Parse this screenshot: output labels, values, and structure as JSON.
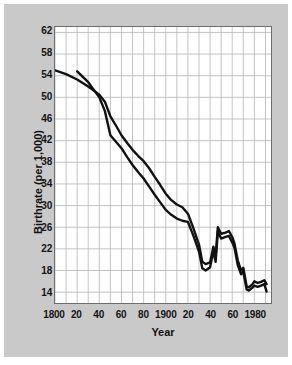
{
  "figure": {
    "background_color": "#c9c9c9",
    "plot_background_color": "#ffffff",
    "grid_color": "#b4b4b4",
    "axis_color": "#6e6e6e",
    "line_color": "#111111"
  },
  "chart_data": {
    "type": "line",
    "title": "",
    "xlabel": "Year",
    "ylabel": "Birthrate (per 1,000)",
    "xlim": [
      1800,
      1995
    ],
    "ylim": [
      12,
      63
    ],
    "grid": true,
    "legend": "none",
    "xticks": [
      {
        "value": 1800,
        "label": "1800"
      },
      {
        "value": 1820,
        "label": "20"
      },
      {
        "value": 1840,
        "label": "40"
      },
      {
        "value": 1860,
        "label": "60"
      },
      {
        "value": 1880,
        "label": "80"
      },
      {
        "value": 1900,
        "label": "1900"
      },
      {
        "value": 1920,
        "label": "20"
      },
      {
        "value": 1940,
        "label": "40"
      },
      {
        "value": 1960,
        "label": "60"
      },
      {
        "value": 1980,
        "label": "1980"
      }
    ],
    "xminor_step": 10,
    "yticks": [
      {
        "value": 62,
        "label": "62"
      },
      {
        "value": 58,
        "label": "58"
      },
      {
        "value": 54,
        "label": "54"
      },
      {
        "value": 50,
        "label": "50"
      },
      {
        "value": 46,
        "label": "46"
      },
      {
        "value": 42,
        "label": "42"
      },
      {
        "value": 38,
        "label": "38"
      },
      {
        "value": 34,
        "label": "34"
      },
      {
        "value": 30,
        "label": "30"
      },
      {
        "value": 26,
        "label": "26"
      },
      {
        "value": 22,
        "label": "22"
      },
      {
        "value": 18,
        "label": "18"
      },
      {
        "value": 14,
        "label": "14"
      }
    ],
    "series": [
      {
        "name": "series-upper",
        "x": [
          1800,
          1810,
          1820,
          1830,
          1840,
          1845,
          1850,
          1855,
          1860,
          1865,
          1870,
          1875,
          1880,
          1885,
          1890,
          1895,
          1900,
          1905,
          1910,
          1915,
          1920,
          1925,
          1930,
          1933,
          1936,
          1940,
          1943,
          1945,
          1947,
          1950,
          1954,
          1957,
          1960,
          1962,
          1965,
          1968,
          1970,
          1973,
          1975,
          1978,
          1980,
          1983,
          1986,
          1989,
          1991
        ],
        "y": [
          55.0,
          54.3,
          53.3,
          52.0,
          50.5,
          49.2,
          46.5,
          44.8,
          43.0,
          41.6,
          40.3,
          39.2,
          38.2,
          36.9,
          35.3,
          33.8,
          32.2,
          31.0,
          30.2,
          29.7,
          28.5,
          25.8,
          22.8,
          19.6,
          19.2,
          19.5,
          22.4,
          20.6,
          26.0,
          24.8,
          25.0,
          25.3,
          24.2,
          23.0,
          19.9,
          18.0,
          18.5,
          15.1,
          14.9,
          15.4,
          16.0,
          15.7,
          15.9,
          16.2,
          15.5
        ]
      },
      {
        "name": "series-lower",
        "x": [
          1820,
          1830,
          1840,
          1845,
          1850,
          1855,
          1860,
          1865,
          1870,
          1875,
          1880,
          1885,
          1890,
          1895,
          1900,
          1905,
          1910,
          1915,
          1920,
          1925,
          1930,
          1933,
          1936,
          1940,
          1943,
          1945,
          1947,
          1950,
          1954,
          1957,
          1960,
          1962,
          1965,
          1968,
          1970,
          1973,
          1975,
          1978,
          1980,
          1983,
          1986,
          1989,
          1991
        ],
        "y": [
          54.8,
          52.8,
          50.0,
          47.5,
          43.0,
          41.8,
          40.6,
          39.0,
          37.5,
          36.2,
          35.0,
          33.5,
          32.0,
          30.6,
          29.2,
          28.3,
          27.6,
          27.2,
          27.0,
          24.4,
          21.5,
          18.4,
          18.0,
          18.6,
          21.6,
          19.6,
          25.2,
          23.9,
          24.2,
          24.4,
          23.2,
          22.2,
          19.0,
          17.3,
          17.8,
          14.5,
          14.3,
          14.8,
          15.2,
          15.0,
          15.2,
          15.5,
          14.1
        ]
      }
    ]
  }
}
